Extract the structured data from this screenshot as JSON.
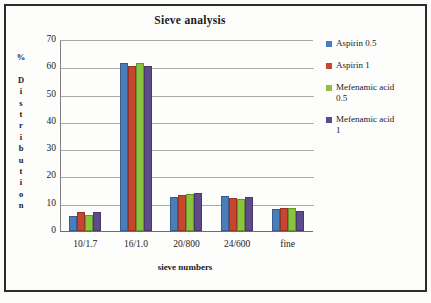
{
  "chart_data": {
    "type": "bar",
    "title": "Sieve analysis",
    "xlabel": "sieve numbers",
    "ylabel": "% Distribution",
    "ylabel_chars": [
      "%",
      "",
      "D",
      "i",
      "s",
      "t",
      "r",
      "i",
      "b",
      "u",
      "t",
      "i",
      "o",
      "n"
    ],
    "categories": [
      "10/1.7",
      "16/1.0",
      "20/800",
      "24/600",
      "fine"
    ],
    "ylim": [
      0,
      70
    ],
    "yticks": [
      70,
      60,
      50,
      40,
      30,
      20,
      10,
      0
    ],
    "grid": true,
    "legend_position": "right",
    "series": [
      {
        "name": "Aspirin 0.5",
        "color": "#4a7ebb",
        "values": [
          5.5,
          61.5,
          12.3,
          13.0,
          8.0
        ]
      },
      {
        "name": "Aspirin 1",
        "color": "#c8462f",
        "values": [
          7.0,
          60.3,
          13.2,
          12.0,
          8.5
        ]
      },
      {
        "name": "Mefenamic acid\n0.5",
        "color": "#8ac43f",
        "values": [
          6.0,
          61.4,
          13.4,
          11.8,
          8.4
        ]
      },
      {
        "name": "Mefenamic acid\n1",
        "color": "#5f4b8b",
        "values": [
          7.0,
          60.3,
          13.9,
          12.3,
          7.5
        ]
      }
    ]
  }
}
